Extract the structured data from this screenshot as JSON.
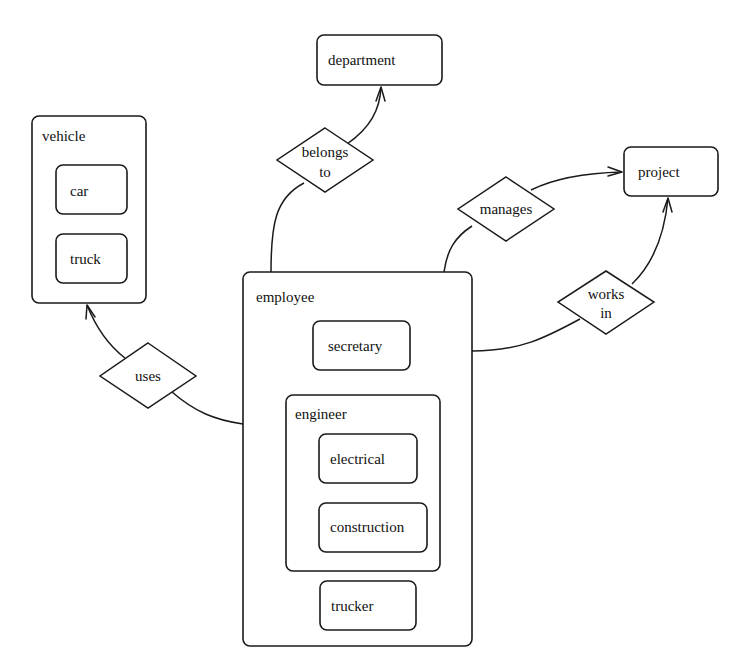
{
  "diagram": {
    "type": "er-diagram-with-subtype-nesting",
    "entities": {
      "vehicle": {
        "label": "vehicle",
        "subtypes": [
          "car",
          "truck"
        ]
      },
      "car": {
        "label": "car"
      },
      "truck": {
        "label": "truck"
      },
      "department": {
        "label": "department"
      },
      "project": {
        "label": "project"
      },
      "employee": {
        "label": "employee",
        "subtypes": [
          "secretary",
          "engineer",
          "trucker"
        ]
      },
      "secretary": {
        "label": "secretary"
      },
      "engineer": {
        "label": "engineer",
        "subtypes": [
          "electrical",
          "construction"
        ]
      },
      "electrical": {
        "label": "electrical"
      },
      "construction": {
        "label": "construction"
      },
      "trucker": {
        "label": "trucker"
      }
    },
    "relationships": {
      "belongs_to": {
        "line1": "belongs",
        "line2": "to",
        "from": "employee",
        "to": "department"
      },
      "manages": {
        "label": "manages",
        "from": "employee",
        "to": "project"
      },
      "works_in": {
        "line1": "works",
        "line2": "in",
        "from": "employee",
        "to": "project"
      },
      "uses": {
        "label": "uses",
        "from": "employee",
        "to": "vehicle"
      }
    },
    "colors": {
      "stroke": "#1a1a1a",
      "background": "#ffffff",
      "text": "#111111"
    }
  }
}
